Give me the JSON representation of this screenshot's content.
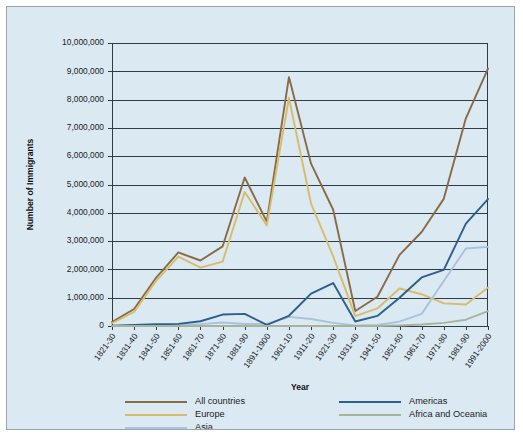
{
  "chart_data": {
    "type": "line",
    "title": "",
    "xlabel": "Year",
    "ylabel": "Number of Immigrants",
    "ylim": [
      0,
      10000000
    ],
    "ytick_values": [
      0,
      1000000,
      2000000,
      3000000,
      4000000,
      5000000,
      6000000,
      7000000,
      8000000,
      9000000,
      10000000
    ],
    "ytick_labels": [
      "0",
      "1,000,000",
      "2,000,000",
      "3,000,000",
      "4,000,000",
      "5,000,000",
      "6,000,000",
      "7,000,000",
      "8,000,000",
      "9,000,000",
      "10,000,000"
    ],
    "grid": true,
    "legend_position": "bottom",
    "categories": [
      "1821-30",
      "1831-40",
      "1841-50",
      "1851-60",
      "1861-70",
      "1871-80",
      "1881-90",
      "1891-1900",
      "1901-10",
      "1911-20",
      "1921-30",
      "1931-40",
      "1941-50",
      "1951-60",
      "1961-70",
      "1971-80",
      "1981-90",
      "1991-2000"
    ],
    "series": [
      {
        "name": "All countries",
        "color": "#8a6a45",
        "values": [
          143000,
          600000,
          1713000,
          2598000,
          2315000,
          2812000,
          5247000,
          3688000,
          8795000,
          5736000,
          4107000,
          528000,
          1035000,
          2515000,
          3322000,
          4493000,
          7338000,
          9095000
        ]
      },
      {
        "name": "Europe",
        "color": "#d9bc6a",
        "values": [
          98000,
          496000,
          1597000,
          2453000,
          2065000,
          2272000,
          4735000,
          3555000,
          8056000,
          4322000,
          2463000,
          348000,
          621000,
          1326000,
          1123000,
          800000,
          762000,
          1360000
        ]
      },
      {
        "name": "Asia",
        "color": "#a8c2e0",
        "values": [
          0,
          0,
          0,
          42000,
          65000,
          124000,
          70000,
          75000,
          324000,
          247000,
          112000,
          17000,
          37000,
          153000,
          428000,
          1588000,
          2738000,
          2796000
        ]
      },
      {
        "name": "Americas",
        "color": "#2b5f8e",
        "values": [
          12000,
          33000,
          62000,
          75000,
          167000,
          405000,
          427000,
          39000,
          362000,
          1144000,
          1517000,
          160000,
          355000,
          997000,
          1716000,
          1983000,
          3616000,
          4487000
        ]
      },
      {
        "name": "Africa and Oceania",
        "color": "#a8b49a",
        "values": [
          0,
          0,
          0,
          0,
          0,
          0,
          0,
          0,
          0,
          0,
          0,
          0,
          0,
          20000,
          52000,
          110000,
          222000,
          525000
        ]
      }
    ]
  },
  "legend": {
    "entries": [
      {
        "label": "All countries",
        "color": "#8a6a45"
      },
      {
        "label": "Europe",
        "color": "#d9bc6a"
      },
      {
        "label": "Asia",
        "color": "#a8c2e0"
      },
      {
        "label": "Americas",
        "color": "#2b5f8e"
      },
      {
        "label": "Africa and Oceania",
        "color": "#a8b49a"
      }
    ]
  },
  "figure": {
    "background_color": "#dbe9f3",
    "border_color": "#9aa4ab",
    "axis_color": "#2f3b46"
  }
}
